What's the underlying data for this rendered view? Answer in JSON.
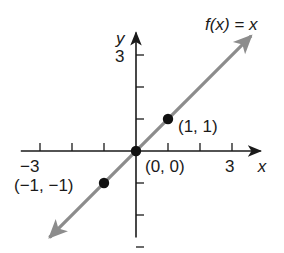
{
  "chart_data": {
    "type": "line",
    "title": "f(x) = x",
    "function_label": "f(x) = x",
    "xlabel": "x",
    "ylabel": "y",
    "xlim": [
      -3.6,
      3.9
    ],
    "ylim": [
      -2.7,
      3.7
    ],
    "x_tick_values": [
      -3,
      -2,
      -1,
      1,
      2,
      3
    ],
    "y_tick_values": [
      -3,
      -2,
      -1,
      1,
      2,
      3
    ],
    "x_tick_labels": [
      {
        "value": -3,
        "label": "−3"
      },
      {
        "value": 3,
        "label": "3"
      }
    ],
    "y_tick_labels": [
      {
        "value": 3,
        "label": "3"
      }
    ],
    "grid": false,
    "series": [
      {
        "name": "f(x) = x",
        "x": [
          -2.7,
          3.6
        ],
        "y": [
          -2.7,
          3.6
        ],
        "color": "#8c8c8c",
        "arrows_both_ends": true
      }
    ],
    "points": [
      {
        "x": -1,
        "y": -1,
        "label": "(−1, −1)"
      },
      {
        "x": 0,
        "y": 0,
        "label": "(0, 0)"
      },
      {
        "x": 1,
        "y": 1,
        "label": "(1, 1)"
      }
    ],
    "colors": {
      "axis": "#1a1a1a",
      "line": "#8c8c8c",
      "points": "#111111"
    }
  }
}
